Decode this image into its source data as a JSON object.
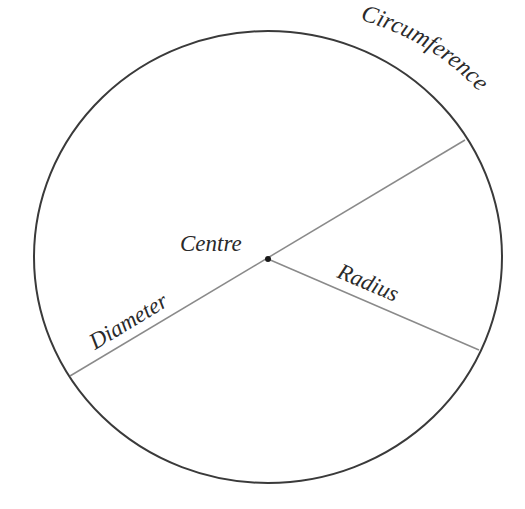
{
  "diagram": {
    "labels": {
      "circumference": "Circumference",
      "centre": "Centre",
      "radius": "Radius",
      "diameter": "Diameter"
    },
    "colors": {
      "circle_stroke": "#3a3a3a",
      "line_stroke": "#8a8a8a",
      "text": "#2a2a2a"
    }
  }
}
